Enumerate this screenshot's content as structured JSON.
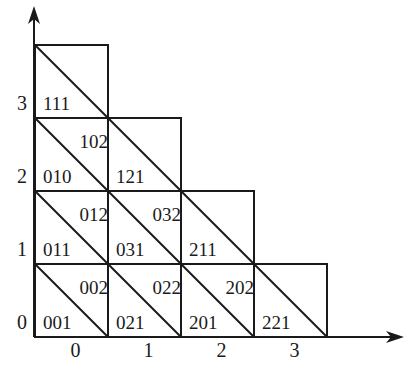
{
  "diagram": {
    "type": "triangulated-staircase-grid",
    "axes": {
      "x_ticks": [
        "0",
        "1",
        "2",
        "3"
      ],
      "y_ticks": [
        "0",
        "1",
        "2",
        "3"
      ]
    },
    "cells": [
      {
        "col": 0,
        "row": 3,
        "lower": "111",
        "upper": ""
      },
      {
        "col": 0,
        "row": 2,
        "lower": "010",
        "upper": "102"
      },
      {
        "col": 1,
        "row": 2,
        "lower": "121",
        "upper": ""
      },
      {
        "col": 0,
        "row": 1,
        "lower": "011",
        "upper": "012"
      },
      {
        "col": 1,
        "row": 1,
        "lower": "031",
        "upper": "032"
      },
      {
        "col": 2,
        "row": 1,
        "lower": "211",
        "upper": ""
      },
      {
        "col": 0,
        "row": 0,
        "lower": "001",
        "upper": "002"
      },
      {
        "col": 1,
        "row": 0,
        "lower": "021",
        "upper": "022"
      },
      {
        "col": 2,
        "row": 0,
        "lower": "201",
        "upper": "202"
      },
      {
        "col": 3,
        "row": 0,
        "lower": "221",
        "upper": ""
      }
    ],
    "colors": {
      "ink": "#1a1a1a",
      "background": "#ffffff"
    }
  }
}
